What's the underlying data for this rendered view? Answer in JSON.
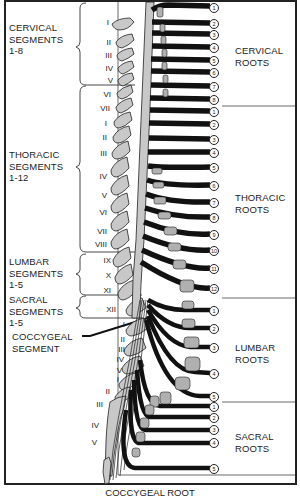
{
  "diagram": {
    "caption": "COCCYGEAL ROOT",
    "left_labels": {
      "cervical": "CERVICAL\nSEGMENTS\n1-8",
      "thoracic": "THORACIC\nSEGMENTS\n1-12",
      "lumbar": "LUMBAR\nSEGMENTS\n1-5",
      "sacral": "SACRAL\nSEGMENTS\n1-5",
      "coccygeal": "COCCYGEAL\nSEGMENT"
    },
    "right_labels": {
      "cervical": "CERVICAL\nROOTS",
      "thoracic": "THORACIC\nROOTS",
      "lumbar": "LUMBAR\nROOTS",
      "sacral": "SACRAL\nROOTS"
    },
    "vertebra_numerals": {
      "cervical": [
        "I",
        "II",
        "III",
        "IV",
        "V",
        "VI",
        "VII"
      ],
      "thoracic": [
        "I",
        "II",
        "III",
        "IV",
        "V",
        "VI",
        "VII",
        "VIII",
        "IX",
        "X",
        "XI",
        "XII"
      ],
      "lumbar": [
        "I",
        "II",
        "III",
        "IV",
        "V"
      ],
      "sacral": [
        "I",
        "II",
        "III",
        "IV",
        "V"
      ]
    },
    "root_numbers": {
      "cervical": [
        "1",
        "2",
        "3",
        "4",
        "5",
        "6",
        "7",
        "8"
      ],
      "thoracic": [
        "1",
        "2",
        "3",
        "4",
        "5",
        "6",
        "7",
        "8",
        "9",
        "10",
        "11",
        "12"
      ],
      "lumbar": [
        "1",
        "2",
        "3",
        "4",
        "5"
      ],
      "sacral": [
        "1",
        "2",
        "3",
        "4",
        "5"
      ]
    },
    "colors": {
      "bone": "#c8c8c8",
      "nerve": "#111111",
      "line": "#333333",
      "background": "#ffffff"
    }
  }
}
